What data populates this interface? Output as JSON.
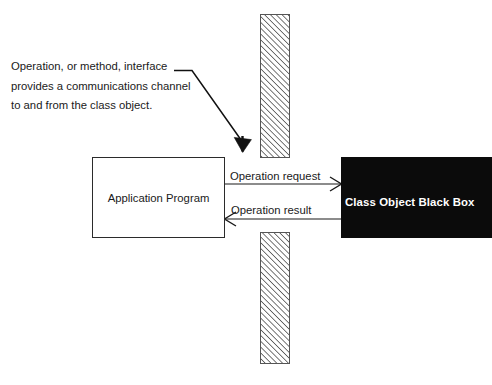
{
  "diagram": {
    "title_annotation": "Operation, or method, interface\nprovides a communications channel\nto and from  the class object.",
    "nodes": {
      "application_program": {
        "label": "Application Program",
        "kind": "rectangle",
        "fill": "#ffffff",
        "stroke": "#2b2b2b"
      },
      "class_object": {
        "label": "Class Object Black Box",
        "kind": "filled-rectangle",
        "fill": "#0b0b0b",
        "text_color": "#ffffff"
      },
      "boundary_wall": {
        "name": "hatched-boundary-wall",
        "description": "vertical hatched barrier with a gap",
        "hatch_color": "#4d4d4d",
        "stroke": "#555555",
        "segments": [
          {
            "label": "upper-wall-segment"
          },
          {
            "label": "lower-wall-segment"
          }
        ]
      }
    },
    "edges": [
      {
        "name": "operation-request-arrow",
        "label": "Operation request",
        "from": "application_program",
        "to": "class_object",
        "direction": "right",
        "arrowhead": "open-v",
        "color": "#1a1a1a"
      },
      {
        "name": "operation-result-arrow",
        "label": "Operation result",
        "from": "class_object",
        "to": "application_program",
        "direction": "left",
        "arrowhead": "open-v",
        "color": "#1a1a1a"
      },
      {
        "name": "annotation-leader-arrow",
        "label": "",
        "from": "title_annotation",
        "to": "boundary_wall",
        "direction": "down-right",
        "arrowhead": "solid-triangle",
        "color": "#111111"
      }
    ],
    "colors": {
      "background": "#ffffff",
      "ink": "#1a1a1a",
      "black_box_fill": "#0b0b0b"
    }
  }
}
